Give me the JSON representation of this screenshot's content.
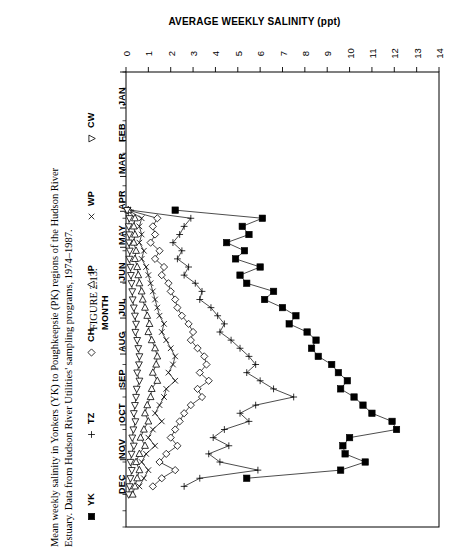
{
  "figure": {
    "number_label": "FIGURE 2.13.",
    "caption_lines": [
      "Mean weekly salinity in Yonkers (YK) to Poughkeepsie (PK) regions of the Hudson River",
      "Estuary. Data from Hudson River Utilities' sampling programs, 1974–1987."
    ]
  },
  "legend": {
    "items": [
      {
        "label": "YK",
        "symbol": "filled-square"
      },
      {
        "label": "TZ",
        "symbol": "plus"
      },
      {
        "label": "CH",
        "symbol": "diamond"
      },
      {
        "label": "IP",
        "symbol": "triangle-up"
      },
      {
        "label": "WP",
        "symbol": "cross"
      },
      {
        "label": "CW",
        "symbol": "triangle-down"
      }
    ]
  },
  "chart_data": {
    "type": "line",
    "title": "AVERAGE WEEKLY SALINITY (ppt)",
    "xlabel": "AVERAGE WEEKLY SALINITY (ppt)",
    "ylabel": "MONTH",
    "orientation": "horizontal-value-vertical-time",
    "grid": false,
    "legend_position": "left-outside",
    "xlim": [
      0,
      14
    ],
    "xticks": [
      0,
      1,
      2,
      3,
      4,
      5,
      6,
      7,
      8,
      9,
      10,
      11,
      12,
      13,
      14
    ],
    "ytick_labels": [
      "JAN",
      "FEB",
      "MAR",
      "APR",
      "MAY",
      "JUN",
      "JUL",
      "AUG",
      "SEP",
      "OCT",
      "NOV",
      "DEC"
    ],
    "ylim_weeks": [
      0,
      56
    ],
    "series": [
      {
        "name": "YK",
        "symbol": "filled-square",
        "x_weeks": [
          17,
          18,
          19,
          20,
          21,
          22,
          23,
          24,
          25,
          26,
          27,
          28,
          29,
          30,
          31,
          32,
          33,
          34,
          35,
          36,
          37,
          38,
          39,
          40,
          41,
          42,
          43,
          44,
          45,
          46,
          47,
          48,
          49,
          50
        ],
        "values": [
          2.2,
          6.1,
          5.2,
          5.5,
          4.5,
          5.3,
          4.9,
          6.0,
          5.1,
          5.4,
          6.6,
          6.2,
          7.0,
          7.6,
          7.3,
          8.1,
          8.5,
          8.3,
          8.6,
          9.2,
          9.5,
          9.9,
          9.6,
          10.2,
          10.6,
          11.0,
          11.9,
          12.1,
          10.0,
          9.7,
          9.8,
          10.7,
          9.6,
          5.4
        ]
      },
      {
        "name": "TZ",
        "symbol": "plus",
        "x_weeks": [
          17,
          18,
          19,
          20,
          21,
          22,
          23,
          24,
          25,
          26,
          27,
          28,
          29,
          30,
          31,
          32,
          33,
          34,
          35,
          36,
          37,
          38,
          39,
          40,
          41,
          42,
          43,
          44,
          45,
          46,
          47,
          48,
          49,
          50,
          51
        ],
        "values": [
          0.2,
          2.9,
          2.6,
          2.4,
          2.1,
          2.5,
          2.3,
          2.8,
          2.6,
          3.1,
          3.4,
          3.3,
          3.8,
          4.1,
          4.4,
          4.2,
          4.7,
          5.1,
          5.5,
          5.8,
          5.4,
          6.0,
          6.6,
          7.5,
          5.8,
          5.1,
          5.5,
          4.4,
          3.9,
          4.6,
          3.7,
          4.2,
          5.9,
          3.3,
          2.6
        ]
      },
      {
        "name": "CH",
        "symbol": "diamond",
        "x_weeks": [
          17,
          18,
          19,
          20,
          21,
          22,
          23,
          24,
          25,
          26,
          27,
          28,
          29,
          30,
          31,
          32,
          33,
          34,
          35,
          36,
          37,
          38,
          39,
          40,
          41,
          42,
          43,
          44,
          45,
          46,
          47,
          48,
          49,
          50,
          51
        ],
        "values": [
          0.1,
          1.4,
          1.2,
          1.3,
          1.1,
          1.5,
          1.3,
          1.7,
          1.6,
          1.9,
          2.0,
          2.2,
          2.3,
          2.5,
          2.8,
          3.0,
          2.9,
          3.2,
          3.5,
          3.6,
          3.3,
          3.7,
          3.2,
          3.4,
          2.9,
          2.6,
          2.4,
          2.2,
          2.0,
          2.3,
          1.8,
          1.5,
          2.2,
          1.6,
          1.2
        ]
      },
      {
        "name": "WP",
        "symbol": "cross",
        "x_weeks": [
          17,
          18,
          19,
          20,
          21,
          22,
          23,
          24,
          25,
          26,
          27,
          28,
          29,
          30,
          31,
          32,
          33,
          34,
          35,
          36,
          37,
          38,
          39,
          40,
          41,
          42,
          43,
          44,
          45,
          46,
          47,
          48,
          49,
          50,
          51
        ],
        "values": [
          0.1,
          0.7,
          0.6,
          0.7,
          0.6,
          0.8,
          0.7,
          0.9,
          1.0,
          1.1,
          1.2,
          1.3,
          1.4,
          1.5,
          1.7,
          1.6,
          1.8,
          2.0,
          2.2,
          2.1,
          1.9,
          2.2,
          1.8,
          1.7,
          1.5,
          1.3,
          1.6,
          1.2,
          1.0,
          1.3,
          0.9,
          0.7,
          1.0,
          0.8,
          0.6
        ]
      },
      {
        "name": "IP",
        "symbol": "triangle-up",
        "x_weeks": [
          17,
          18,
          19,
          20,
          21,
          22,
          23,
          24,
          25,
          26,
          27,
          28,
          29,
          30,
          31,
          32,
          33,
          34,
          35,
          36,
          37,
          38,
          39,
          40,
          41,
          42,
          43,
          44,
          45,
          46,
          47,
          48,
          49,
          50,
          51,
          52
        ],
        "values": [
          0.1,
          0.4,
          0.35,
          0.4,
          0.35,
          0.45,
          0.4,
          0.5,
          0.55,
          0.6,
          0.7,
          0.75,
          0.85,
          0.95,
          1.05,
          1.0,
          1.15,
          1.3,
          1.4,
          1.35,
          1.2,
          1.4,
          1.15,
          1.1,
          0.95,
          0.85,
          1.0,
          0.8,
          0.65,
          0.85,
          0.6,
          0.45,
          0.6,
          0.5,
          0.4,
          0.3
        ]
      },
      {
        "name": "CW",
        "symbol": "triangle-down",
        "x_weeks": [
          17,
          18,
          19,
          20,
          21,
          22,
          23,
          24,
          25,
          26,
          27,
          28,
          29,
          30,
          31,
          32,
          33,
          34,
          35,
          36,
          37,
          38,
          39,
          40,
          41,
          42,
          43,
          44,
          45,
          46,
          47,
          48,
          49,
          50,
          51,
          52
        ],
        "values": [
          0.05,
          0.15,
          0.12,
          0.15,
          0.13,
          0.17,
          0.15,
          0.2,
          0.22,
          0.25,
          0.28,
          0.3,
          0.35,
          0.4,
          0.45,
          0.42,
          0.5,
          0.55,
          0.6,
          0.58,
          0.5,
          0.6,
          0.48,
          0.45,
          0.4,
          0.35,
          0.42,
          0.33,
          0.28,
          0.35,
          0.25,
          0.2,
          0.26,
          0.2,
          0.16,
          0.12
        ]
      }
    ]
  }
}
